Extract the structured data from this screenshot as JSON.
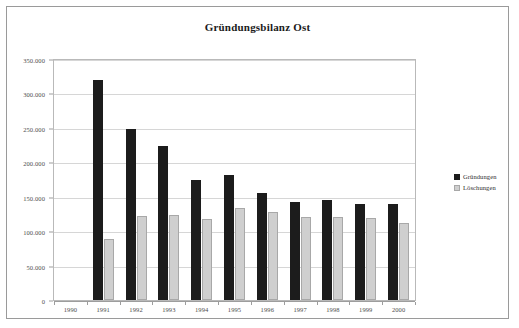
{
  "chart_data": {
    "type": "bar",
    "title": "Gründungsbilanz Ost",
    "xlabel": "",
    "ylabel": "",
    "categories": [
      "1990",
      "1991",
      "1992",
      "1993",
      "1994",
      "1995",
      "1996",
      "1997",
      "1998",
      "1999",
      "2000"
    ],
    "series": [
      {
        "name": "Gründungen",
        "color": "#1c1c1c",
        "values": [
          0,
          320000,
          248000,
          223000,
          175000,
          181000,
          155000,
          142000,
          145000,
          139000,
          140000
        ]
      },
      {
        "name": "Löschungen",
        "color": "#cfcfcf",
        "values": [
          0,
          88000,
          122000,
          124000,
          117000,
          133000,
          128000,
          120000,
          121000,
          119000,
          112000
        ]
      }
    ],
    "ylim": [
      0,
      350000
    ],
    "ytick_values": [
      0,
      50000,
      100000,
      150000,
      200000,
      250000,
      300000,
      350000
    ],
    "ytick_labels": [
      "0",
      "50.000",
      "100.000",
      "150.000",
      "200.000",
      "250.000",
      "300.000",
      "350.000"
    ],
    "grid": true,
    "legend_position": "right"
  },
  "legend": {
    "items": [
      {
        "label": "Gründungen",
        "swatch": "black"
      },
      {
        "label": "Löschungen",
        "swatch": "gray"
      }
    ]
  }
}
